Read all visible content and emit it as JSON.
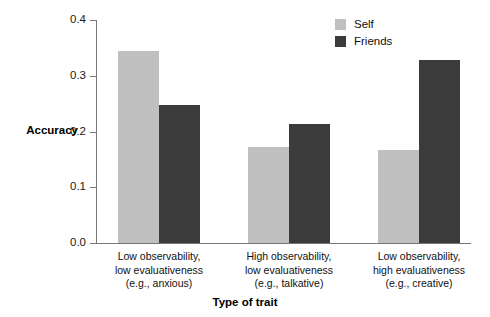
{
  "chart_data": {
    "type": "bar",
    "title": "",
    "xlabel": "Type of trait",
    "ylabel": "Accuracy",
    "ylim": [
      0.0,
      0.4
    ],
    "ytick_labels": [
      "0.4",
      "0.3",
      "0.2",
      "0.1",
      "0.0"
    ],
    "ytick_values": [
      0.4,
      0.3,
      0.2,
      0.1,
      0.0
    ],
    "grid": false,
    "legend_position": "top-right",
    "categories": [
      "Low observability, low evaluativeness (e.g., anxious)",
      "High observability, low evaluativeness (e.g., talkative)",
      "Low observability, high evaluativeness (e.g., creative)"
    ],
    "category_lines": [
      [
        "Low observability,",
        "low evaluativeness",
        "(e.g., anxious)"
      ],
      [
        "High observability,",
        "low evaluativeness",
        "(e.g., talkative)"
      ],
      [
        "Low observability,",
        "high evaluativeness",
        "(e.g., creative)"
      ]
    ],
    "series": [
      {
        "name": "Self",
        "color": "#bfbfbf",
        "values": [
          0.345,
          0.172,
          0.167
        ]
      },
      {
        "name": "Friends",
        "color": "#3b3b3b",
        "values": [
          0.247,
          0.214,
          0.328
        ]
      }
    ]
  },
  "legend": {
    "items": [
      {
        "label": "Self",
        "color": "#bfbfbf"
      },
      {
        "label": "Friends",
        "color": "#3b3b3b"
      }
    ]
  },
  "axes": {
    "y_title": "Accuracy",
    "x_title": "Type of trait"
  }
}
